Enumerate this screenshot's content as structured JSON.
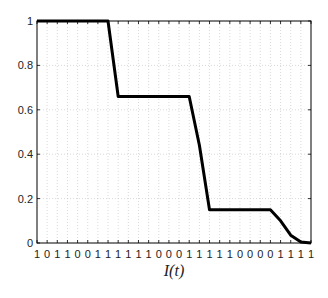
{
  "chart_data": {
    "type": "line",
    "title": "",
    "xlabel": "I(t)",
    "ylabel": "",
    "x_tick_labels": [
      "1",
      "0",
      "1",
      "1",
      "0",
      "0",
      "1",
      "1",
      "1",
      "1",
      "1",
      "1",
      "0",
      "0",
      "0",
      "1",
      "1",
      "1",
      "1",
      "1",
      "0",
      "0",
      "0",
      "0",
      "1",
      "1",
      "1",
      "1"
    ],
    "x": [
      0,
      1,
      2,
      3,
      4,
      5,
      6,
      7,
      8,
      9,
      10,
      11,
      12,
      13,
      14,
      15,
      16,
      17,
      18,
      19,
      20,
      21,
      22,
      23,
      24,
      25,
      26,
      27
    ],
    "series": [
      {
        "name": "step",
        "values": [
          1,
          1,
          1,
          1,
          1,
          1,
          1,
          1,
          0.66,
          0.66,
          0.66,
          0.66,
          0.66,
          0.66,
          0.66,
          0.66,
          0.44,
          0.15,
          0.15,
          0.15,
          0.15,
          0.15,
          0.15,
          0.15,
          0.1,
          0.035,
          0.005,
          0
        ]
      }
    ],
    "y_ticks": [
      0,
      0.2,
      0.4,
      0.6,
      0.8,
      1
    ],
    "y_tick_labels": [
      "0",
      "0.2",
      "0.4",
      "0.6",
      "0.8",
      "1"
    ],
    "ylim": [
      0,
      1
    ],
    "xlim": [
      0,
      27
    ],
    "grid": true,
    "legend": null,
    "colors": {
      "line": "#000000",
      "grid": "#bfbfbf",
      "axis": "#000000"
    }
  }
}
